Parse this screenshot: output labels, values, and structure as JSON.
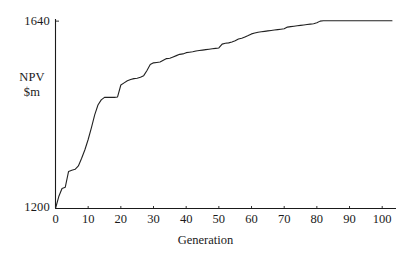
{
  "chart_data": {
    "type": "line",
    "title": "",
    "subtitle": "",
    "xlabel": "Generation",
    "ylabel": "NPV\n$m",
    "ylabel_line1": "NPV",
    "ylabel_line2": "$m",
    "xlim": [
      0,
      103
    ],
    "ylim": [
      1200,
      1645
    ],
    "xticks": [
      0,
      10,
      20,
      30,
      40,
      50,
      60,
      70,
      80,
      90,
      100
    ],
    "xtick_labels": [
      "0",
      "10",
      "20",
      "30",
      "40",
      "50",
      "60",
      "70",
      "80",
      "90",
      "100"
    ],
    "yticks": [
      1200,
      1640
    ],
    "ytick_labels": [
      "1200",
      "1640"
    ],
    "grid": false,
    "legend": null,
    "line_color": "#222222",
    "line_width": 1.1,
    "series": [
      {
        "name": "Best NPV per generation",
        "x": [
          0,
          1,
          2,
          3,
          4,
          5,
          6,
          7,
          8,
          9,
          10,
          11,
          12,
          13,
          14,
          15,
          16,
          17,
          18,
          19,
          20,
          21,
          22,
          23,
          24,
          25,
          26,
          27,
          28,
          29,
          30,
          31,
          32,
          33,
          34,
          35,
          36,
          37,
          38,
          39,
          40,
          41,
          42,
          43,
          44,
          45,
          46,
          47,
          48,
          49,
          50,
          51,
          52,
          53,
          54,
          55,
          56,
          57,
          58,
          59,
          60,
          61,
          62,
          63,
          64,
          65,
          66,
          67,
          68,
          69,
          70,
          71,
          72,
          73,
          74,
          75,
          76,
          77,
          78,
          79,
          80,
          81,
          82,
          83,
          84,
          85,
          86,
          87,
          88,
          89,
          90,
          91,
          92,
          93,
          94,
          95,
          96,
          97,
          98,
          99,
          100,
          101,
          102,
          103
        ],
        "y": [
          1200,
          1228,
          1247,
          1250,
          1287,
          1290,
          1292,
          1300,
          1318,
          1338,
          1362,
          1390,
          1420,
          1443,
          1455,
          1461,
          1461,
          1461,
          1461,
          1462,
          1490,
          1495,
          1500,
          1503,
          1505,
          1506,
          1508,
          1512,
          1524,
          1538,
          1542,
          1543,
          1544,
          1548,
          1552,
          1553,
          1556,
          1559,
          1562,
          1563,
          1566,
          1567,
          1568,
          1570,
          1571,
          1572,
          1573,
          1574,
          1575,
          1576,
          1577,
          1586,
          1588,
          1589,
          1591,
          1594,
          1598,
          1600,
          1603,
          1606,
          1610,
          1612,
          1614,
          1615,
          1616,
          1617,
          1618,
          1619,
          1620,
          1621,
          1622,
          1626,
          1627,
          1628,
          1629,
          1630,
          1631,
          1632,
          1633,
          1634,
          1636,
          1640,
          1641,
          1641,
          1641,
          1641,
          1641,
          1641,
          1641,
          1641,
          1641,
          1641,
          1641,
          1641,
          1641,
          1641,
          1641,
          1641,
          1641,
          1641,
          1641,
          1641,
          1641,
          1641
        ]
      }
    ]
  },
  "axes": {
    "y_top_label": "1640",
    "y_bottom_label": "1200",
    "y_name_line1": "NPV",
    "y_name_line2": "$m",
    "x_title": "Generation"
  },
  "colors": {
    "line": "#222222",
    "axis": "#1a1a1a",
    "background": "#ffffff",
    "text": "#1a1a1a"
  }
}
